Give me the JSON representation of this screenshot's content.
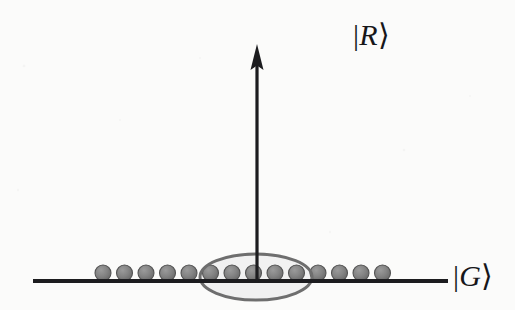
{
  "figure": {
    "kind": "quantum-energy-level-diagram",
    "background_color": "#fbfbfa",
    "ink_color": "#1c1c1f",
    "atom_color": "#808080",
    "atom_edge_color": "#545454",
    "ellipse_stroke_color": "#6e6e6e",
    "ellipse_fill_color": "#efefef"
  },
  "levels": {
    "excited": {
      "name": "rydberg-level",
      "label_full": "|R⟩",
      "ket_open": "|",
      "symbol": "R",
      "ket_close": "⟩",
      "line_x1": 133,
      "line_x2": 343,
      "line_y": 42,
      "line_width": 4
    },
    "ground": {
      "name": "ground-level",
      "label_full": "|G⟩",
      "ket_open": "|",
      "symbol": "G",
      "ket_close": "⟩",
      "line_x1": 33,
      "line_x2": 448,
      "line_y": 281,
      "line_width": 5
    }
  },
  "transition_arrow": {
    "name": "excitation-arrow",
    "x": 257,
    "y_tail": 281,
    "y_head": 46,
    "shaft_width": 3,
    "head_width": 13,
    "head_length": 22,
    "direction": "up"
  },
  "atoms": {
    "count": 14,
    "radius": 8,
    "center_y": 273,
    "spacing": 21.5,
    "first_center_x": 103,
    "centers_x": [
      103,
      124.5,
      146,
      167.5,
      189,
      210.5,
      232,
      253.5,
      275,
      296.5,
      318,
      339.5,
      361,
      382.5
    ]
  },
  "blockade_ellipse": {
    "name": "blockade-region",
    "center_x": 256,
    "center_y": 277,
    "radius_x": 56,
    "radius_y": 23,
    "stroke_width": 3,
    "encircled_atom_count": 6
  },
  "chart_data": {
    "type": "diagram",
    "title": "",
    "annotations": [
      "|R⟩",
      "|G⟩"
    ],
    "series": [
      {
        "name": "excited-state-line",
        "label": "|R⟩",
        "level_y": 42
      },
      {
        "name": "ground-state-line",
        "label": "|G⟩",
        "level_y": 281
      }
    ],
    "atom_count": 14,
    "blockaded_atoms": 6,
    "legend": "none",
    "grid": false
  }
}
